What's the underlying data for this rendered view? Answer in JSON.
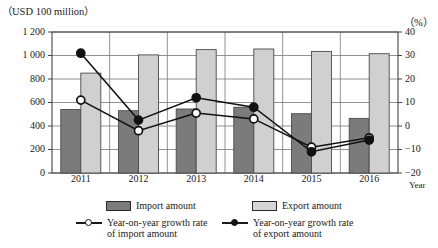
{
  "chart_data": {
    "type": "bar",
    "title": "",
    "subtitle": "",
    "xlabel": "Year",
    "ylabel": "（USD 100 million）",
    "y2label": "（%）",
    "grid": true,
    "legend_position": "bottom",
    "categories": [
      "2011",
      "2012",
      "2013",
      "2014",
      "2015",
      "2016"
    ],
    "ylim": [
      0,
      1200
    ],
    "yticks": [
      "0",
      "200",
      "400",
      "600",
      "800",
      "1 000",
      "1 200"
    ],
    "ytick_values": [
      0,
      200,
      400,
      600,
      800,
      1000,
      1200
    ],
    "y2lim": [
      -20,
      40
    ],
    "y2ticks": [
      "-20",
      "-10",
      "0",
      "10",
      "20",
      "30",
      "40"
    ],
    "y2tick_values": [
      -20,
      -10,
      0,
      10,
      20,
      30,
      40
    ],
    "series": [
      {
        "name": "Import amount",
        "kind": "bar",
        "axis": "left",
        "color": "#7b7b7b",
        "values": [
          540,
          530,
          545,
          560,
          505,
          465
        ]
      },
      {
        "name": "Export amount",
        "kind": "bar",
        "axis": "left",
        "color": "#d0d0d0",
        "values": [
          850,
          1005,
          1050,
          1055,
          1035,
          1015
        ]
      },
      {
        "name": "Year-on-year growth rate of import amount",
        "kind": "line",
        "axis": "right",
        "marker": "open-circle",
        "color": "#111111",
        "values": [
          11,
          -2,
          5.5,
          3,
          -9,
          -5
        ]
      },
      {
        "name": "Year-on-year growth rate of export amount",
        "kind": "line",
        "axis": "right",
        "marker": "filled-circle",
        "color": "#111111",
        "values": [
          31,
          2.5,
          12,
          8,
          -11,
          -6
        ]
      }
    ]
  },
  "legend": {
    "import_bar": "Import amount",
    "export_bar": "Export amount",
    "import_line_l1": "Year-on-year growth rate",
    "import_line_l2": "of import amount",
    "export_line_l1": "Year-on-year growth rate",
    "export_line_l2": "of export amount"
  },
  "colors": {
    "import_bar": "#7b7b7b",
    "export_bar": "#d0d0d0",
    "line": "#111111",
    "axis": "#555555",
    "grid": "#777777"
  }
}
